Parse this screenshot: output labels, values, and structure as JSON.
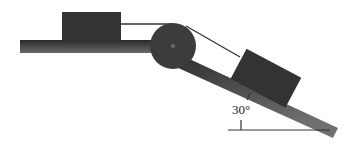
{
  "diagram": {
    "angle_label": "30°",
    "colors": {
      "ink": "#2e2e2e",
      "surface": "#3a3a3a",
      "background": "#ffffff"
    }
  }
}
